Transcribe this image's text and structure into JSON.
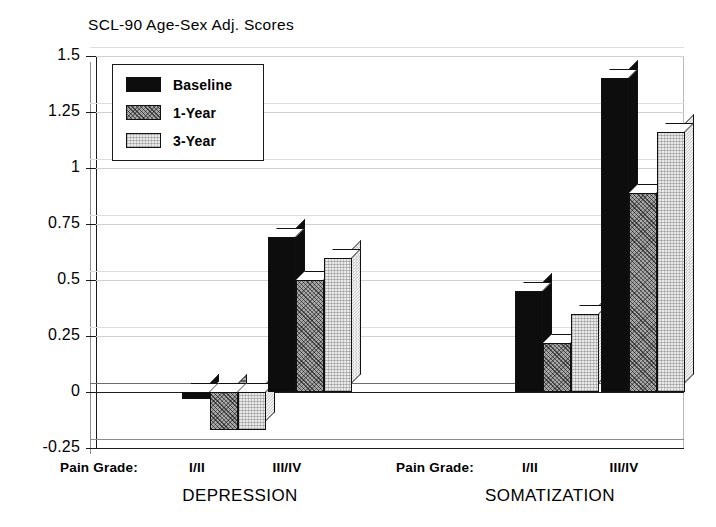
{
  "chart_data": {
    "type": "bar",
    "title": "SCL-90 Age-Sex Adj. Scores",
    "xlabel": "",
    "ylabel": "",
    "ylim": [
      -0.25,
      1.5
    ],
    "yticks": [
      1.5,
      1.25,
      1,
      0.75,
      0.5,
      0.25,
      0,
      -0.25
    ],
    "ytick_labels": [
      "1.5",
      "1.25",
      "1",
      "0.75",
      "0.5",
      "0.25",
      "0",
      "-0.25"
    ],
    "grid": true,
    "legend_position": "upper-left-inside",
    "grouping": "clustered 3D bars, grouped by outcome scale then by pain grade",
    "categories": [
      "DEPRESSION I/II",
      "DEPRESSION III/IV",
      "SOMATIZATION I/II",
      "SOMATIZATION III/IV"
    ],
    "series": [
      {
        "name": "Baseline",
        "color": "#0d0d0d",
        "values": [
          -0.03,
          0.69,
          0.45,
          1.4
        ]
      },
      {
        "name": "1-Year",
        "color": "#a8a8a8",
        "values": [
          -0.17,
          0.5,
          0.22,
          0.89
        ]
      },
      {
        "name": "3-Year",
        "color": "#e9e9e9",
        "values": [
          -0.17,
          0.6,
          0.35,
          1.16
        ]
      }
    ],
    "groups": [
      {
        "scale_label": "DEPRESSION",
        "pain_grade_prefix": "Pain Grade:",
        "pain_grades": [
          "I/II",
          "III/IV"
        ],
        "bars": [
          {
            "grade": "I/II",
            "series": "Baseline",
            "value": -0.03
          },
          {
            "grade": "I/II",
            "series": "1-Year",
            "value": -0.17
          },
          {
            "grade": "I/II",
            "series": "3-Year",
            "value": -0.17
          },
          {
            "grade": "III/IV",
            "series": "Baseline",
            "value": 0.69
          },
          {
            "grade": "III/IV",
            "series": "1-Year",
            "value": 0.5
          },
          {
            "grade": "III/IV",
            "series": "3-Year",
            "value": 0.6
          }
        ]
      },
      {
        "scale_label": "SOMATIZATION",
        "pain_grade_prefix": "Pain Grade:",
        "pain_grades": [
          "I/II",
          "III/IV"
        ],
        "bars": [
          {
            "grade": "I/II",
            "series": "Baseline",
            "value": 0.45
          },
          {
            "grade": "I/II",
            "series": "1-Year",
            "value": 0.22
          },
          {
            "grade": "I/II",
            "series": "3-Year",
            "value": 0.35
          },
          {
            "grade": "III/IV",
            "series": "Baseline",
            "value": 1.4
          },
          {
            "grade": "III/IV",
            "series": "1-Year",
            "value": 0.89
          },
          {
            "grade": "III/IV",
            "series": "3-Year",
            "value": 1.16
          }
        ]
      }
    ]
  },
  "title": "SCL-90 Age-Sex Adj. Scores",
  "legend": {
    "items": [
      {
        "label": "Baseline",
        "swatch": "solid-black-swatch"
      },
      {
        "label": "1-Year",
        "swatch": "dark-hatched-swatch"
      },
      {
        "label": "3-Year",
        "swatch": "light-stippled-swatch"
      }
    ]
  },
  "y_axis": {
    "labels": [
      "1.5",
      "1.25",
      "1",
      "0.75",
      "0.5",
      "0.25",
      "0",
      "-0.25"
    ]
  },
  "x_axis": {
    "depression": {
      "pain_grade_caption": "Pain Grade:",
      "grade_low": "I/II",
      "grade_high": "III/IV",
      "group_label": "DEPRESSION"
    },
    "somatization": {
      "pain_grade_caption": "Pain Grade:",
      "grade_low": "I/II",
      "grade_high": "III/IV",
      "group_label": "SOMATIZATION"
    }
  }
}
